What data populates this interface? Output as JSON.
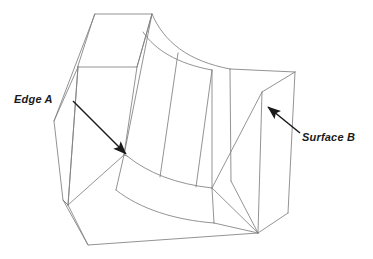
{
  "figure": {
    "type": "isometric-line-drawing",
    "background_color": "#ffffff",
    "line_color": "#808080",
    "heavy_line_color": "#5a5a5a",
    "arrow_color": "#1a1a1a",
    "text_color": "#1a1a1a",
    "width": 373,
    "height": 259
  },
  "annotations": [
    {
      "id": "edge-a",
      "label": "Edge A",
      "style": "italic-bold",
      "text_x": 14,
      "text_y": 93,
      "leader_from_x": 73,
      "leader_from_y": 101,
      "leader_to_x": 128,
      "leader_to_y": 156,
      "points_at": "vertical edge at left of swept surface"
    },
    {
      "id": "surface-b",
      "label": "Surface B",
      "style": "italic-bold",
      "text_x": 302,
      "text_y": 131,
      "leader_from_x": 300,
      "leader_from_y": 133,
      "leader_to_x": 266,
      "leader_to_y": 105,
      "points_at": "right side face of base slab"
    }
  ],
  "geometry": {
    "upper_block": {
      "top_face": [
        [
          95,
          14
        ],
        [
          152,
          14
        ],
        [
          137,
          67
        ],
        [
          78,
          67
        ]
      ],
      "left_face": [
        [
          95,
          14
        ],
        [
          78,
          67
        ],
        [
          63,
          200
        ],
        [
          54,
          121
        ]
      ],
      "front_face": [
        [
          78,
          67
        ],
        [
          137,
          67
        ],
        [
          124,
          155
        ],
        [
          68,
          205
        ]
      ]
    },
    "base_slab": {
      "top_face": [
        [
          230,
          70
        ],
        [
          295,
          72
        ],
        [
          288,
          213
        ],
        [
          212,
          188
        ]
      ],
      "right_face": [
        [
          295,
          72
        ],
        [
          288,
          213
        ],
        [
          258,
          233
        ],
        [
          262,
          92
        ]
      ],
      "bottom_face": [
        [
          68,
          205
        ],
        [
          212,
          188
        ],
        [
          258,
          233
        ],
        [
          88,
          245
        ]
      ]
    },
    "fillet": {
      "upper_curve": [
        [
          152,
          14
        ],
        [
          175,
          48
        ],
        [
          205,
          65
        ],
        [
          230,
          70
        ]
      ],
      "lower_curve_front": [
        [
          128,
          156
        ],
        [
          160,
          176
        ],
        [
          190,
          186
        ],
        [
          212,
          188
        ]
      ],
      "lower_curve_back": [
        [
          118,
          188
        ],
        [
          150,
          208
        ],
        [
          185,
          218
        ],
        [
          212,
          222
        ]
      ],
      "ruling_lines": [
        [
          [
            152,
            14
          ],
          [
            128,
            156
          ]
        ],
        [
          [
            175,
            48
          ],
          [
            160,
            176
          ]
        ],
        [
          [
            205,
            65
          ],
          [
            190,
            186
          ]
        ]
      ]
    }
  }
}
